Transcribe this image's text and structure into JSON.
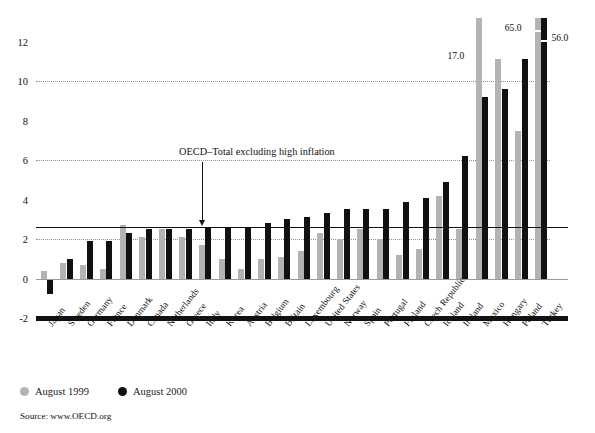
{
  "chart_data": {
    "type": "bar",
    "title": "",
    "subtitle": "",
    "xlabel": "",
    "ylabel": "",
    "ylim": [
      -2,
      13.2
    ],
    "yticks": [
      12,
      10,
      8,
      6,
      4,
      2,
      0,
      -2
    ],
    "ytick_labels": [
      "12",
      "10",
      "8",
      "6",
      "4",
      "2",
      "0",
      "-2"
    ],
    "gridlines": [
      10,
      6,
      2
    ],
    "grid": true,
    "legend_position": "bottom-left",
    "categories": [
      "Japan",
      "Sweden",
      "Germany",
      "France",
      "Denmark",
      "Canada",
      "Netherlands",
      "Greece",
      "Italy",
      "Korea",
      "Austria",
      "Belgium",
      "Britain",
      "Luxembourg",
      "United States",
      "Norway",
      "Spain",
      "Portugal",
      "Finland",
      "Czech Republic",
      "Iceland",
      "Ireland",
      "Mexico",
      "Hungary",
      "Poland",
      "Turkey"
    ],
    "series": [
      {
        "name": "August 1999",
        "color": "#b3b3b3",
        "values": [
          0.4,
          0.8,
          0.7,
          0.5,
          2.7,
          2.1,
          2.5,
          2.1,
          1.7,
          1.0,
          0.5,
          1.0,
          1.1,
          1.4,
          2.3,
          2.0,
          2.5,
          2.0,
          1.2,
          1.5,
          4.2,
          2.5,
          17.0,
          11.1,
          7.5,
          65.0
        ]
      },
      {
        "name": "August 2000",
        "color": "#111111",
        "values": [
          -0.8,
          1.0,
          1.9,
          1.9,
          2.3,
          2.5,
          2.5,
          2.5,
          2.6,
          2.6,
          2.6,
          2.8,
          3.0,
          3.1,
          3.3,
          3.5,
          3.5,
          3.5,
          3.9,
          4.1,
          4.9,
          6.2,
          9.2,
          9.6,
          11.1,
          56.0
        ]
      }
    ],
    "annotations": [
      {
        "id": "mexico-1999",
        "text": "17.0",
        "series": "August 1999",
        "category": "Mexico"
      },
      {
        "id": "turkey-1999",
        "text": "65.0",
        "series": "August 1999",
        "category": "Turkey"
      },
      {
        "id": "turkey-2000",
        "text": "56.0",
        "series": "August 2000",
        "category": "Turkey"
      }
    ],
    "reference_line": {
      "label": "OECD–Total excluding high inflation",
      "value": 2.6,
      "color": "#111111"
    }
  },
  "legend": {
    "series_1_label": "August 1999",
    "series_2_label": "August 2000"
  },
  "footer": {
    "source": "Source: www.OECD.org"
  }
}
